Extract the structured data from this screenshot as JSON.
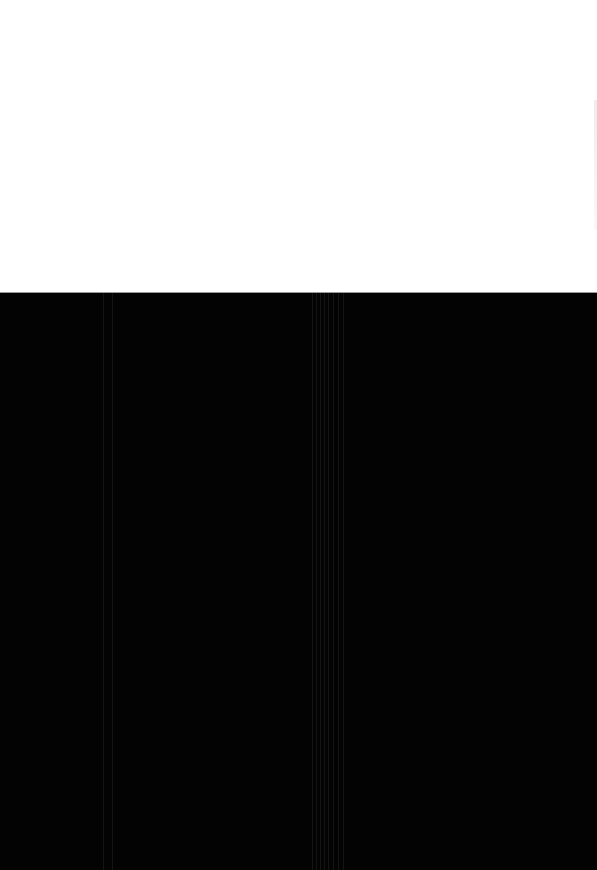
{
  "page": {
    "top_region_color": "#ffffff",
    "bottom_region_color": "#030303",
    "divider_color": "#9a9a9a",
    "faint_header_text": ""
  },
  "artifacts": {
    "streak_positions_px": [
      103,
      112,
      312,
      316,
      320,
      324,
      328,
      333,
      338,
      343
    ]
  }
}
